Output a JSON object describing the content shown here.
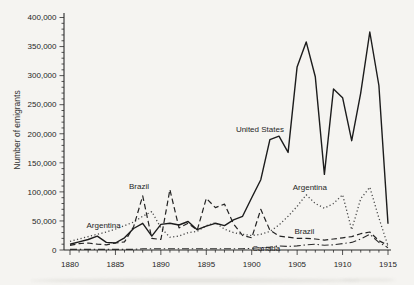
{
  "chart_data": {
    "type": "line",
    "title": "",
    "xlabel": "",
    "ylabel": "Number of emigrants",
    "xlim": [
      1880,
      1915
    ],
    "ylim": [
      0,
      400000
    ],
    "grid": false,
    "legend": "inline-annotations",
    "x_minor_step": 1,
    "y_minor_step": 10000,
    "x_major_ticks": [
      1880,
      1885,
      1890,
      1895,
      1900,
      1905,
      1910,
      1915
    ],
    "x_tick_labels": [
      "1880",
      "1885",
      "1890",
      "1895",
      "1900",
      "1905",
      "1910",
      "1915"
    ],
    "y_major_ticks": [
      0,
      50000,
      100000,
      150000,
      200000,
      250000,
      300000,
      350000,
      400000
    ],
    "y_tick_labels": [
      "0",
      "50,000",
      "100,000",
      "150,000",
      "200,000",
      "250,000",
      "300,000",
      "350,000",
      "400,000"
    ],
    "x": [
      1880,
      1881,
      1882,
      1883,
      1884,
      1885,
      1886,
      1887,
      1888,
      1889,
      1890,
      1891,
      1892,
      1893,
      1894,
      1895,
      1896,
      1897,
      1898,
      1899,
      1900,
      1901,
      1902,
      1903,
      1904,
      1905,
      1906,
      1907,
      1908,
      1909,
      1910,
      1911,
      1912,
      1913,
      1914,
      1915
    ],
    "series": [
      {
        "name": "United States",
        "style": "solid",
        "color": "#1c1c1c",
        "values": [
          10000,
          14000,
          18000,
          24000,
          13000,
          12000,
          21000,
          37000,
          46000,
          24000,
          44000,
          46000,
          43000,
          49000,
          35000,
          41000,
          46000,
          42000,
          52000,
          58000,
          90000,
          121000,
          190000,
          196000,
          168000,
          315000,
          358000,
          298000,
          130000,
          277000,
          262000,
          188000,
          270000,
          375000,
          283000,
          45000
        ]
      },
      {
        "name": "Brazil",
        "style": "dashed",
        "color": "#232323",
        "values": [
          8000,
          11000,
          12000,
          10000,
          9000,
          12000,
          14000,
          40000,
          93000,
          20000,
          18000,
          104000,
          38000,
          46000,
          34000,
          89000,
          73000,
          79000,
          45000,
          25000,
          21000,
          70000,
          34000,
          24000,
          22000,
          20000,
          20000,
          19000,
          17000,
          19000,
          21000,
          23000,
          28000,
          31000,
          16000,
          8000
        ]
      },
      {
        "name": "Argentina",
        "style": "dotted",
        "color": "#4a4a4a",
        "values": [
          15000,
          19000,
          23000,
          27000,
          31000,
          36000,
          42000,
          48000,
          58000,
          66000,
          38000,
          22000,
          24000,
          30000,
          32000,
          42000,
          47000,
          36000,
          30000,
          27000,
          25000,
          27000,
          32000,
          43000,
          58000,
          75000,
          95000,
          80000,
          72000,
          80000,
          95000,
          35000,
          88000,
          108000,
          55000,
          7000
        ]
      },
      {
        "name": "Canada",
        "style": "dashdot",
        "color": "#2e2e2e",
        "values": [
          1000,
          1000,
          1000,
          1000,
          1000,
          1000,
          1000,
          1000,
          2000,
          2000,
          2000,
          2000,
          2000,
          2000,
          2000,
          2000,
          2000,
          2000,
          2000,
          2000,
          3000,
          4000,
          5000,
          7000,
          6000,
          7000,
          9000,
          10000,
          8000,
          9000,
          11000,
          13000,
          19000,
          27000,
          13000,
          4000
        ]
      }
    ],
    "annotations": [
      {
        "text": "United States",
        "year": 1900.9,
        "value": 208000
      },
      {
        "text": "Brazil",
        "year": 1887.6,
        "value": 110000
      },
      {
        "text": "Argentina",
        "year": 1883.7,
        "value": 43000
      },
      {
        "text": "Argentina",
        "year": 1906.4,
        "value": 108000
      },
      {
        "text": "Brazil",
        "year": 1905.8,
        "value": 32000
      },
      {
        "text": "Canada",
        "year": 1901.6,
        "value": 2600
      }
    ],
    "axis_color": "#2b2b2b",
    "background_color": "#f5f4f1"
  }
}
